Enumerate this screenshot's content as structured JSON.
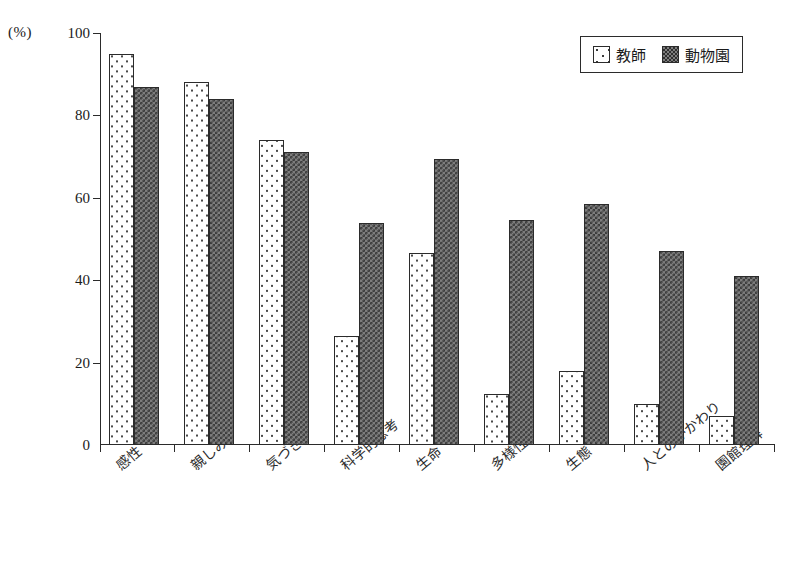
{
  "chart_data": {
    "type": "bar",
    "title": "",
    "xlabel": "",
    "ylabel": "(%)",
    "ylim": [
      0,
      100
    ],
    "yticks": [
      0,
      20,
      40,
      60,
      80,
      100
    ],
    "grid": false,
    "legend_position": "top-right",
    "categories": [
      "感性",
      "親しみ",
      "気づき",
      "科学的思考",
      "生命",
      "多様性",
      "生態",
      "人とのかかわり",
      "園館理解"
    ],
    "series": [
      {
        "name": "教師",
        "pattern": "dotted",
        "values": [
          95,
          88,
          74,
          26.5,
          46.5,
          12.5,
          18,
          10,
          7
        ]
      },
      {
        "name": "動物園",
        "pattern": "checkered",
        "values": [
          87,
          84,
          71,
          54,
          69.5,
          54.5,
          58.5,
          47,
          41
        ]
      }
    ]
  },
  "axis": {
    "unit_label": "(%)",
    "ytick_labels": [
      "100",
      "80",
      "60",
      "40",
      "20",
      "0"
    ]
  },
  "legend": {
    "entries": [
      {
        "label": "教師",
        "swatch": "dotted-swatch-icon"
      },
      {
        "label": "動物園",
        "swatch": "checkered-swatch-icon"
      }
    ]
  },
  "colors": {
    "axis": "#2b2b2b",
    "teacher_fill": "#ffffff",
    "teacher_dots": "#4a4a4a",
    "zoo_fill": "#7d7d7d",
    "zoo_hatch": "#3a3a3a",
    "background": "#ffffff"
  }
}
